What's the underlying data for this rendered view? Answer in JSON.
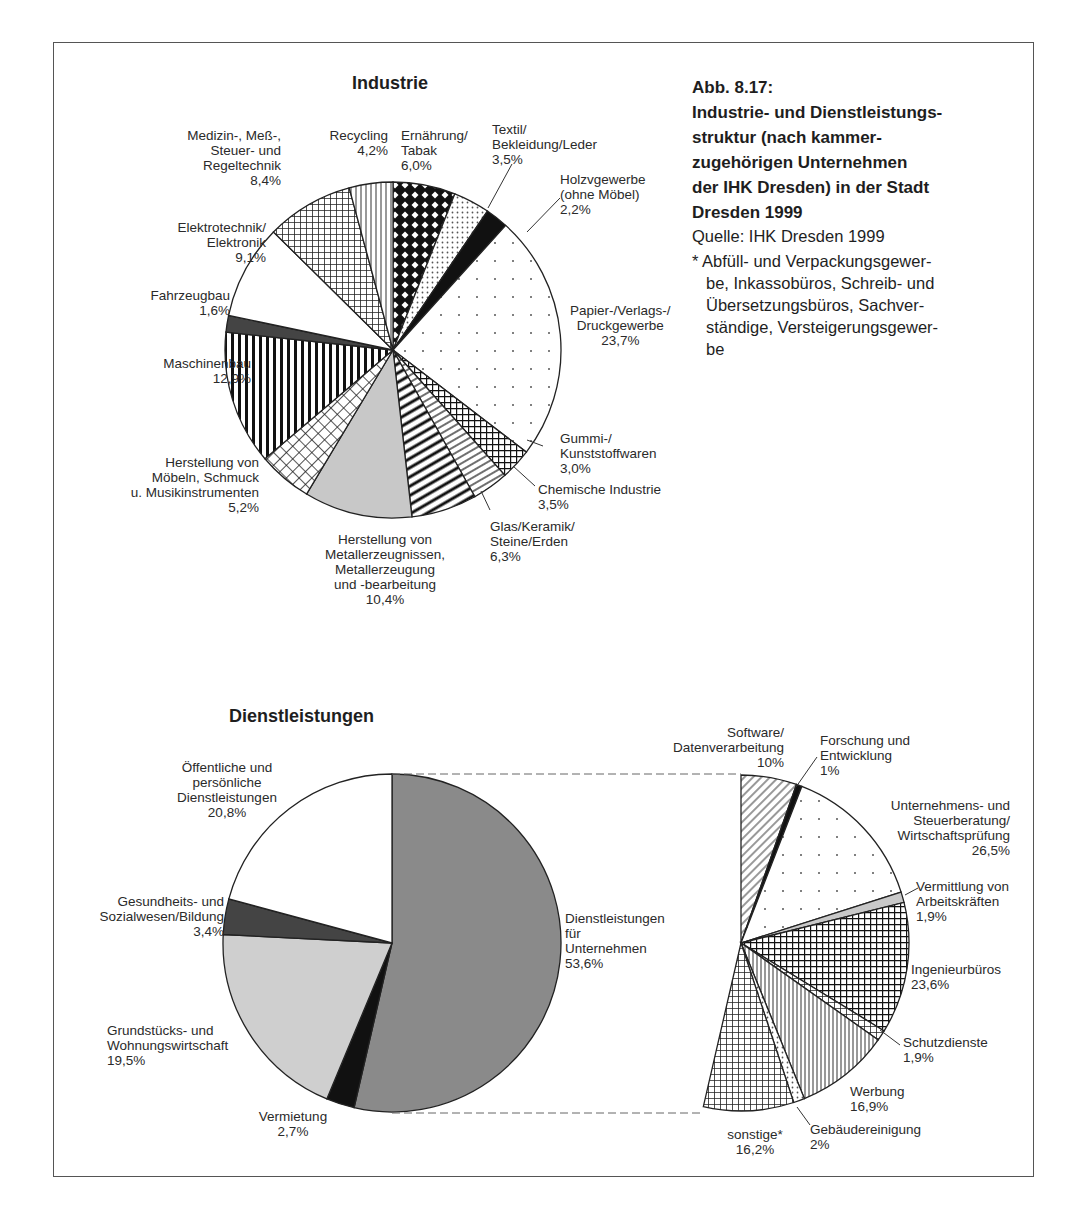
{
  "caption": {
    "figure": "Abb. 8.17:",
    "title_lines": [
      "Industrie- und Dienstleistungs-",
      "struktur (nach kammer-",
      "zugehörigen Unternehmen",
      "der IHK Dresden) in der Stadt",
      "Dresden 1999"
    ],
    "source": "Quelle: IHK Dresden 1999",
    "footnote_lines": [
      "* Abfüll- und Verpackungsgewer-",
      "be, Inkassobüros, Schreib- und",
      "Übersetzungsbüros,  Sachver-",
      "ständige, Versteigerungsgewer-",
      "be"
    ]
  },
  "chart_data": [
    {
      "type": "pie",
      "title": "Industrie",
      "start": "12 o'clock, clockwise",
      "categories": [
        "Ernährung/Tabak",
        "Textil/Bekleidung/Leder",
        "Holzvgewerbe (ohne Möbel)",
        "Papier-/Verlags-/Druckgewerbe",
        "Gummi-/Kunststoffwaren",
        "Chemische Industrie",
        "Glas/Keramik/Steine/Erden",
        "Herstellung von Metallerzeugnissen, Metallerzeugung und -bearbeitung",
        "Herstellung von Möbeln, Schmuck u. Musikinstrumenten",
        "Maschinenbau",
        "Fahrzeugbau",
        "Elektrotechnik/Elektronik",
        "Medizin-, Meß-, Steuer- und Regeltechnik",
        "Recycling"
      ],
      "values": [
        6.0,
        3.5,
        2.2,
        23.7,
        3.0,
        3.5,
        6.3,
        10.4,
        5.2,
        12.9,
        1.6,
        9.1,
        8.4,
        4.2
      ],
      "unit": "%"
    },
    {
      "type": "pie",
      "title": "Dienstleistungen",
      "start": "12 o'clock, clockwise",
      "categories": [
        "Dienstleistungen für Unternehmen",
        "Vermietung",
        "Grundstücks- und Wohnungswirtschaft",
        "Gesundheits- und Sozialwesen/Bildung",
        "Öffentliche und persönliche Dienstleistungen"
      ],
      "values": [
        53.6,
        2.7,
        19.5,
        3.4,
        20.8
      ],
      "unit": "%"
    },
    {
      "type": "pie",
      "title": "Dienstleistungen für Unternehmen (Aufgliederung)",
      "start": "12 o'clock, clockwise, spanning 53.6% of circle",
      "categories": [
        "Software/Datenverarbeitung",
        "Forschung und Entwicklung",
        "Unternehmens- und Steuerberatung/Wirtschaftsprüfung",
        "Vermittlung von Arbeitskräften",
        "Ingenieurbüros",
        "Schutzdienste",
        "Werbung",
        "Gebäudereinigung",
        "sonstige*"
      ],
      "values": [
        10,
        1,
        26.5,
        1.9,
        23.6,
        1.9,
        16.9,
        2,
        16.2
      ],
      "unit": "%"
    }
  ],
  "industrie": {
    "title": "Industrie",
    "labels": {
      "ernaehrung": [
        "Ernährung/",
        "Tabak",
        "6,0%"
      ],
      "textil": [
        "Textil/",
        "Bekleidung/Leder",
        "3,5%"
      ],
      "holz": [
        "Holzvgewerbe",
        "(ohne Möbel)",
        "2,2%"
      ],
      "papier": [
        "Papier-/Verlags-/",
        "Druckgewerbe",
        "23,7%"
      ],
      "gummi": [
        "Gummi-/",
        "Kunststoffwaren",
        "3,0%"
      ],
      "chemie": [
        "Chemische Industrie",
        "3,5%"
      ],
      "glas": [
        "Glas/Keramik/",
        "Steine/Erden",
        "6,3%"
      ],
      "metall": [
        "Herstellung von",
        "Metallerzeugnissen,",
        "Metallerzeugung",
        "und -bearbeitung",
        "10,4%"
      ],
      "moebel": [
        "Herstellung von",
        "Möbeln, Schmuck",
        "u. Musikinstrumenten",
        "5,2%"
      ],
      "maschinen": [
        "Maschinenbau",
        "12,9%"
      ],
      "fahrzeug": [
        "Fahrzeugbau",
        "1,6%"
      ],
      "elektro": [
        "Elektrotechnik/",
        "Elektronik",
        "9,1%"
      ],
      "medizin": [
        "Medizin-, Meß-,",
        "Steuer- und",
        "Regeltechnik",
        "8,4%"
      ],
      "recycling": [
        "Recycling",
        "4,2%"
      ]
    }
  },
  "dienst": {
    "title": "Dienstleistungen",
    "labels": {
      "unternehmen": [
        "Dienstleistungen",
        "für",
        "Unternehmen",
        "53,6%"
      ],
      "vermietung": [
        "Vermietung",
        "2,7%"
      ],
      "grundstueck": [
        "Grundstücks- und",
        "Wohnungswirtschaft",
        "19,5%"
      ],
      "gesundheit": [
        "Gesundheits- und",
        "Sozialwesen/Bildung",
        "3,4%"
      ],
      "oeffentlich": [
        "Öffentliche und",
        "persönliche",
        "Dienstleistungen",
        "20,8%"
      ]
    }
  },
  "breakdown": {
    "labels": {
      "software": [
        "Software/",
        "Datenverarbeitung",
        "10%"
      ],
      "forschung": [
        "Forschung und",
        "Entwicklung",
        "1%"
      ],
      "beratung": [
        "Unternehmens- und",
        "Steuerberatung/",
        "Wirtschaftsprüfung",
        "26,5%"
      ],
      "vermittlung": [
        "Vermittlung von",
        "Arbeitskräften",
        "1,9%"
      ],
      "ingenieur": [
        "Ingenieurbüros",
        "23,6%"
      ],
      "schutz": [
        "Schutzdienste",
        "1,9%"
      ],
      "werbung": [
        "Werbung",
        "16,9%"
      ],
      "gebaeude": [
        "Gebäudereinigung",
        "2%"
      ],
      "sonstige": [
        "sonstige*",
        "16,2%"
      ]
    }
  }
}
